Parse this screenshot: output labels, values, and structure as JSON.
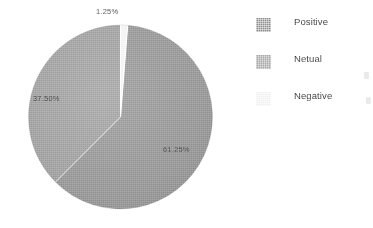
{
  "figure": {
    "background_color": "#ffffff",
    "width": 373,
    "height": 228
  },
  "chart_data": {
    "type": "pie",
    "title": "",
    "subtitle": "",
    "xlabel": "",
    "ylabel": "",
    "grid": false,
    "legend_position": "right",
    "start_angle_deg": 0,
    "direction": "clockwise",
    "categories": [
      "Positive",
      "Netual",
      "Negative"
    ],
    "values": [
      61.25,
      37.5,
      1.25
    ],
    "value_unit": "percent",
    "data_labels": [
      "61.25%",
      "37.50%",
      "1.25%"
    ],
    "slices": [
      {
        "label": "Negative",
        "value": 1.25,
        "display": "1.25%",
        "color": "#f2f2f2",
        "start_deg": 0,
        "end_deg": 4.5
      },
      {
        "label": "Positive",
        "value": 61.25,
        "display": "61.25%",
        "color": "#8d8d8d",
        "start_deg": 4.5,
        "end_deg": 225.0
      },
      {
        "label": "Netual",
        "value": 37.5,
        "display": "37.50%",
        "color": "#979797",
        "start_deg": 225.0,
        "end_deg": 360.0
      }
    ],
    "labels": [
      {
        "text": "1.25%",
        "series": "Negative"
      },
      {
        "text": "37.50%",
        "series": "Netual"
      },
      {
        "text": "61.25%",
        "series": "Positive"
      }
    ]
  },
  "pie_labels": {
    "negative": "1.25%",
    "netual": "37.50%",
    "positive": "61.25%"
  },
  "legend": {
    "items": [
      {
        "label": "Positive",
        "color": "#8d8d8d",
        "swatch_name": "legend-swatch-positive"
      },
      {
        "label": "Netual",
        "color": "#979797",
        "swatch_name": "legend-swatch-netual"
      },
      {
        "label": "Negative",
        "color": "#f0f0f0",
        "swatch_name": "legend-swatch-negative"
      }
    ]
  },
  "colors": {
    "positive": "#8d8d8d",
    "netual": "#979797",
    "negative": "#f0f0f0",
    "label_text": "#3b3b3b",
    "legend_text": "#2f2f2f",
    "background": "#ffffff"
  }
}
